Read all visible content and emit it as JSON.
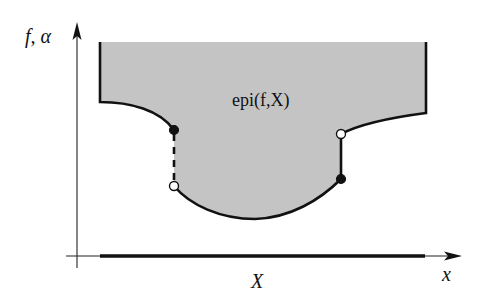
{
  "diagram": {
    "type": "epigraph-illustration",
    "colors": {
      "region_fill": "#c4c4c4",
      "stroke": "#111111",
      "axis": "#222222",
      "background": "#ffffff"
    },
    "labels": {
      "y_axis": "f, α",
      "x_axis": "x",
      "domain_set": "X",
      "region": "epi(f,X)"
    },
    "markers": [
      {
        "name": "left-jump-upper",
        "style": "filled"
      },
      {
        "name": "left-jump-lower",
        "style": "open"
      },
      {
        "name": "right-jump-upper",
        "style": "open"
      },
      {
        "name": "right-jump-lower",
        "style": "filled"
      }
    ]
  }
}
